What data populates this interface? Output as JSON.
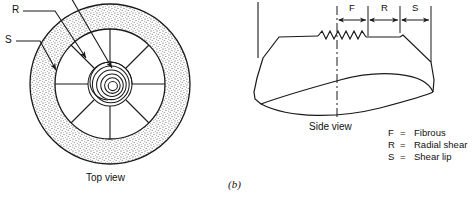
{
  "figure": {
    "caption": "(b)",
    "top_view_label": "Top view",
    "side_view_label": "Side view"
  },
  "callouts": {
    "r_label": "R",
    "s_label": "S"
  },
  "dimensions": {
    "segments": [
      {
        "label": "F"
      },
      {
        "label": "R"
      },
      {
        "label": "S"
      }
    ]
  },
  "legend": {
    "entries": [
      {
        "key": "F",
        "eq": "=",
        "text": "Fibrous"
      },
      {
        "key": "R",
        "eq": "=",
        "text": "Radial shear"
      },
      {
        "key": "S",
        "eq": "=",
        "text": "Shear lip"
      }
    ]
  },
  "colors": {
    "line": "#1a1a1a",
    "background": "#ffffff",
    "stipple": "#4a4a4a"
  }
}
